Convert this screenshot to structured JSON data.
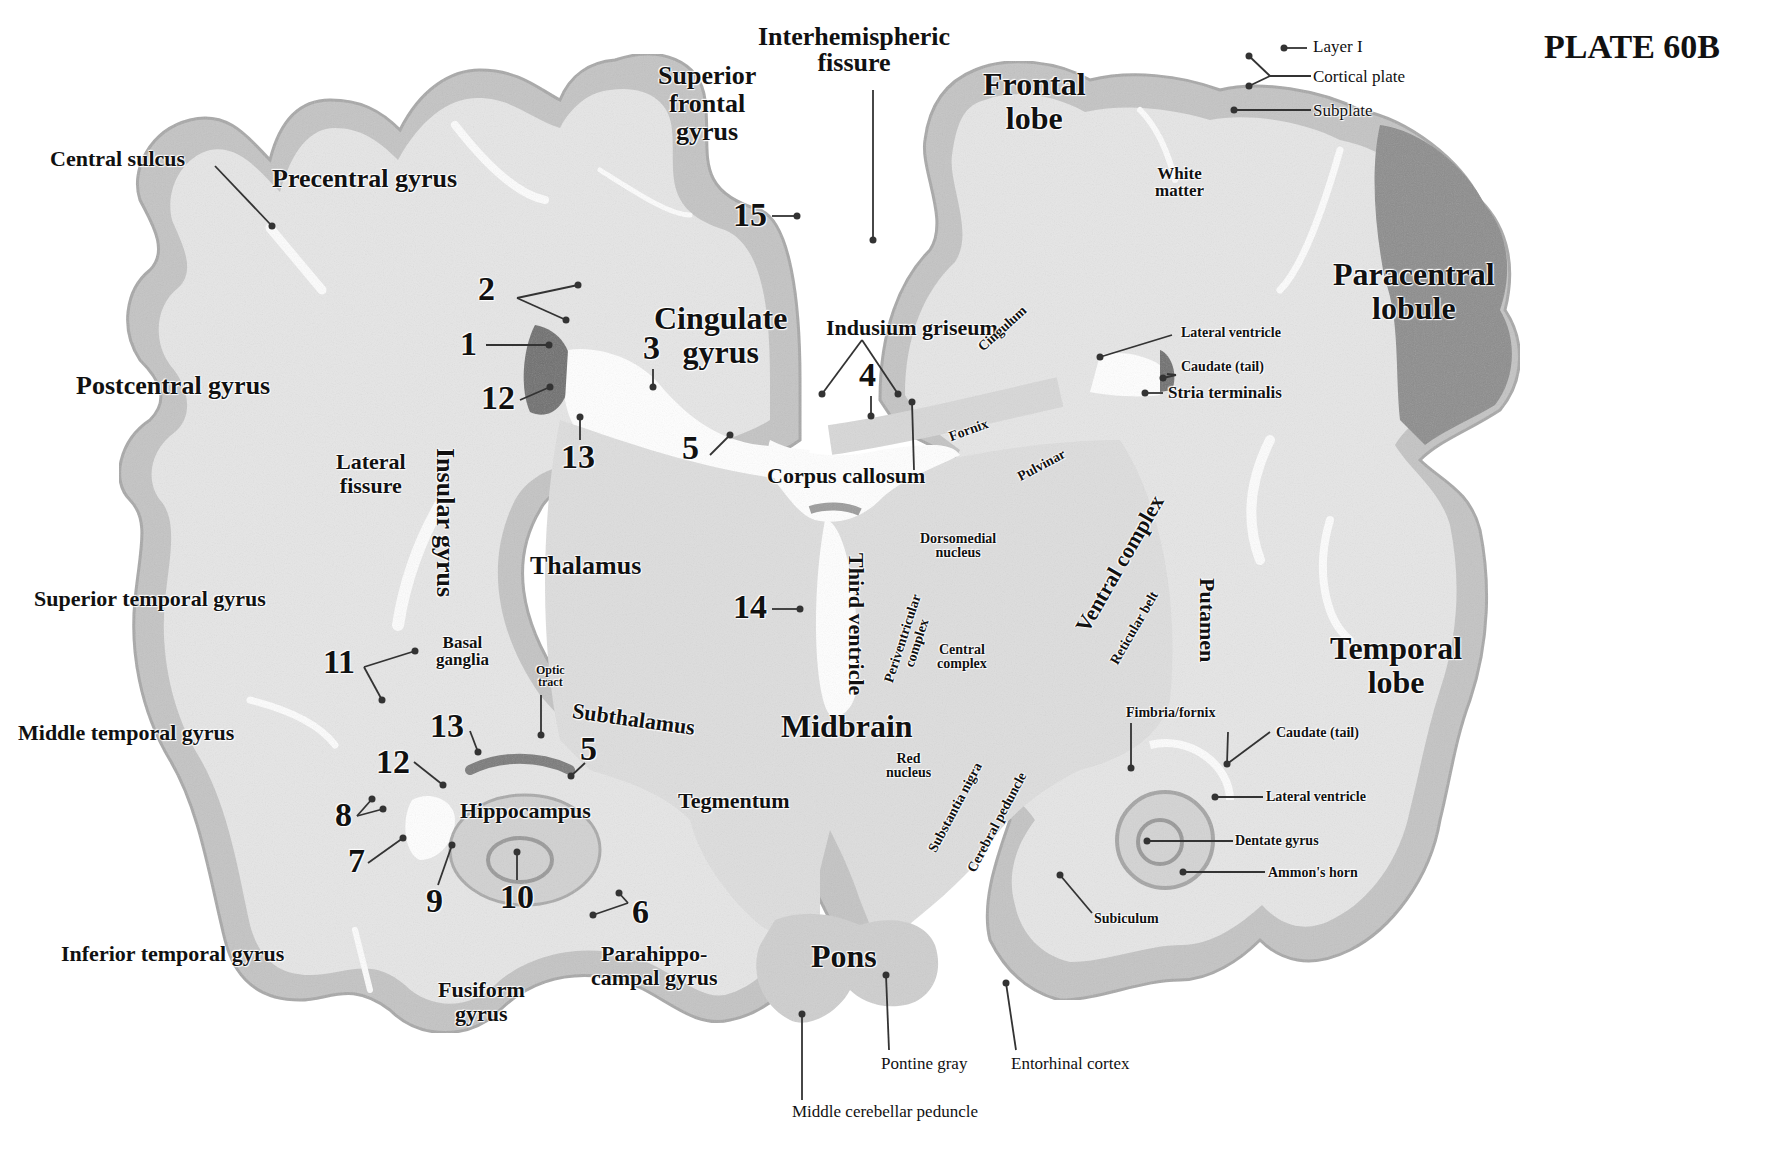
{
  "plate": {
    "title": "PLATE 60B"
  },
  "colors": {
    "background": "#ffffff",
    "white_matter": "#e4e4e4",
    "cortex": "#bdbdbd",
    "dark_cortex": "#8f8f8f",
    "ventricle": "#ffffff",
    "text": "#111111",
    "leader": "#333333"
  },
  "regions": {
    "interhemispheric_fissure": "Interhemispheric fissure",
    "superior_frontal_gyrus": "Superior frontal gyrus",
    "frontal_lobe": "Frontal lobe",
    "central_sulcus": "Central sulcus",
    "precentral_gyrus": "Precentral gyrus",
    "postcentral_gyrus": "Postcentral gyrus",
    "cingulate_gyrus": "Cingulate gyrus",
    "paracentral_lobule": "Paracentral lobule",
    "white_matter": "White matter",
    "lateral_fissure": "Lateral fissure",
    "insular_gyrus": "Insular gyrus",
    "thalamus": "Thalamus",
    "superior_temporal_gyrus": "Superior temporal gyrus",
    "middle_temporal_gyrus": "Middle temporal gyrus",
    "inferior_temporal_gyrus": "Inferior temporal gyrus",
    "basal_ganglia": "Basal ganglia",
    "optic_tract": "Optic tract",
    "subthalamus": "Subthalamus",
    "midbrain": "Midbrain",
    "hippocampus": "Hippocampus",
    "tegmentum": "Tegmentum",
    "fusiform_gyrus": "Fusiform gyrus",
    "parahippocampal_gyrus": "Parahippocampal gyrus",
    "pons": "Pons",
    "temporal_lobe": "Temporal lobe",
    "third_ventricle": "Third ventricle",
    "corpus_callosum": "Corpus callosum",
    "indusium_griseum": "Indusium griseum"
  },
  "labels": {
    "interhemispheric_1": "Interhemispheric",
    "interhemispheric_2": "fissure",
    "sfg_1": "Superior",
    "sfg_2": "frontal",
    "sfg_3": "gyrus",
    "frontal_1": "Frontal",
    "frontal_2": "lobe",
    "central_sulcus": "Central sulcus",
    "precentral": "Precentral gyrus",
    "postcentral": "Postcentral gyrus",
    "cingulate_1": "Cingulate",
    "cingulate_2": "gyrus",
    "paracentral_1": "Paracentral",
    "paracentral_2": "lobule",
    "white_matter_1": "White",
    "white_matter_2": "matter",
    "layer_i": "Layer I",
    "cortical_plate": "Cortical plate",
    "subplate": "Subplate",
    "indusium": "Indusium griseum",
    "cingulum": "Cingulum",
    "lateral_ventricle_top": "Lateral ventricle",
    "caudate_tail_top": "Caudate (tail)",
    "stria_terminalis": "Stria terminalis",
    "fornix": "Fornix",
    "pulvinar": "Pulvinar",
    "corpus_callosum": "Corpus callosum",
    "lateral_fissure_1": "Lateral",
    "lateral_fissure_2": "fissure",
    "insular_gyrus": "Insular gyrus",
    "thalamus": "Thalamus",
    "third_ventricle": "Third ventricle",
    "dorsomedial_1": "Dorsomedial",
    "dorsomedial_2": "nucleus",
    "periventricular_1": "Periventricular",
    "periventricular_2": "complex",
    "central_complex_1": "Central",
    "central_complex_2": "complex",
    "ventral_complex": "Ventral complex",
    "reticular_belt": "Reticular belt",
    "putamen": "Putamen",
    "superior_temporal": "Superior temporal gyrus",
    "middle_temporal": "Middle temporal gyrus",
    "inferior_temporal": "Inferior temporal gyrus",
    "basal_ganglia_1": "Basal",
    "basal_ganglia_2": "ganglia",
    "optic_tract_1": "Optic",
    "optic_tract_2": "tract",
    "subthalamus": "Subthalamus",
    "midbrain": "Midbrain",
    "red_nucleus_1": "Red",
    "red_nucleus_2": "nucleus",
    "hippocampus": "Hippocampus",
    "tegmentum": "Tegmentum",
    "substantia_nigra": "Substantia nigra",
    "cerebral_peduncle": "Cerebral peduncle",
    "temporal_1": "Temporal",
    "temporal_2": "lobe",
    "fimbria_fornix": "Fimbria/fornix",
    "caudate_tail_bottom": "Caudate (tail)",
    "lateral_ventricle_bottom": "Lateral ventricle",
    "dentate_gyrus": "Dentate gyrus",
    "ammons_horn": "Ammon's horn",
    "subiculum": "Subiculum",
    "fusiform_1": "Fusiform",
    "fusiform_2": "gyrus",
    "parahippo_1": "Parahippo-",
    "parahippo_2": "campal gyrus",
    "pons": "Pons",
    "pontine_gray": "Pontine gray",
    "entorhinal_cortex": "Entorhinal cortex",
    "middle_cerebellar_peduncle": "Middle cerebellar peduncle"
  },
  "numbered_markers": [
    {
      "id": "1",
      "label": "1"
    },
    {
      "id": "2",
      "label": "2"
    },
    {
      "id": "3",
      "label": "3"
    },
    {
      "id": "4",
      "label": "4"
    },
    {
      "id": "5a",
      "label": "5"
    },
    {
      "id": "5b",
      "label": "5"
    },
    {
      "id": "6",
      "label": "6"
    },
    {
      "id": "7",
      "label": "7"
    },
    {
      "id": "8",
      "label": "8"
    },
    {
      "id": "9",
      "label": "9"
    },
    {
      "id": "10",
      "label": "10"
    },
    {
      "id": "11",
      "label": "11"
    },
    {
      "id": "12a",
      "label": "12"
    },
    {
      "id": "12b",
      "label": "12"
    },
    {
      "id": "13a",
      "label": "13"
    },
    {
      "id": "13b",
      "label": "13"
    },
    {
      "id": "14",
      "label": "14"
    },
    {
      "id": "15",
      "label": "15"
    }
  ]
}
